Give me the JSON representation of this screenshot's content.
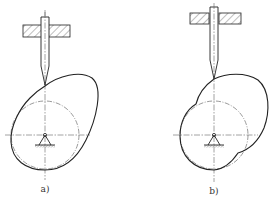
{
  "figure": {
    "panels": [
      {
        "id": "a",
        "label": "a)",
        "cam_shape": "eccentric oval cam",
        "follower": "knife-edge translating follower",
        "pivot": "fixed ground pivot"
      },
      {
        "id": "b",
        "label": "b)",
        "cam_shape": "lobed cam with concave flank",
        "follower": "knife-edge translating follower",
        "pivot": "fixed ground pivot"
      }
    ]
  }
}
